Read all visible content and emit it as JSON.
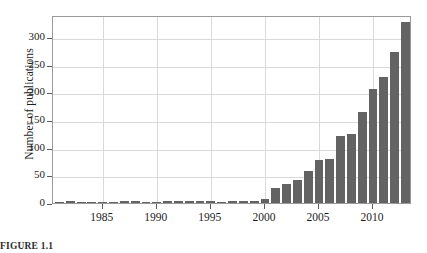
{
  "figure": {
    "caption": "FIGURE 1.1"
  },
  "chart_data": {
    "type": "bar",
    "title": "",
    "xlabel": "",
    "ylabel": "Number of publications",
    "xlim": [
      1980.4,
      2013.6
    ],
    "ylim": [
      0,
      340
    ],
    "grid": true,
    "legend": "none",
    "bar_color": "#636363",
    "yticks": [
      0,
      50,
      100,
      150,
      200,
      250,
      300
    ],
    "ytick_labels": [
      "0",
      "50",
      "100",
      "150",
      "200",
      "250",
      "300"
    ],
    "xticks": [
      1985,
      1990,
      1995,
      2000,
      2005,
      2010
    ],
    "xtick_labels": [
      "1985",
      "1990",
      "1995",
      "2000",
      "2005",
      "2010"
    ],
    "categories": [
      1981,
      1982,
      1983,
      1984,
      1985,
      1986,
      1987,
      1988,
      1989,
      1990,
      1991,
      1992,
      1993,
      1994,
      1995,
      1996,
      1997,
      1998,
      1999,
      2000,
      2001,
      2002,
      2003,
      2004,
      2005,
      2006,
      2007,
      2008,
      2009,
      2010,
      2011,
      2012,
      2013
    ],
    "values": [
      0,
      1,
      0,
      0,
      0,
      0,
      1,
      1,
      0,
      0,
      1,
      1,
      1,
      1,
      2,
      0,
      1,
      3,
      4,
      7,
      28,
      34,
      41,
      57,
      77,
      80,
      121,
      124,
      164,
      207,
      228,
      273,
      328
    ]
  }
}
